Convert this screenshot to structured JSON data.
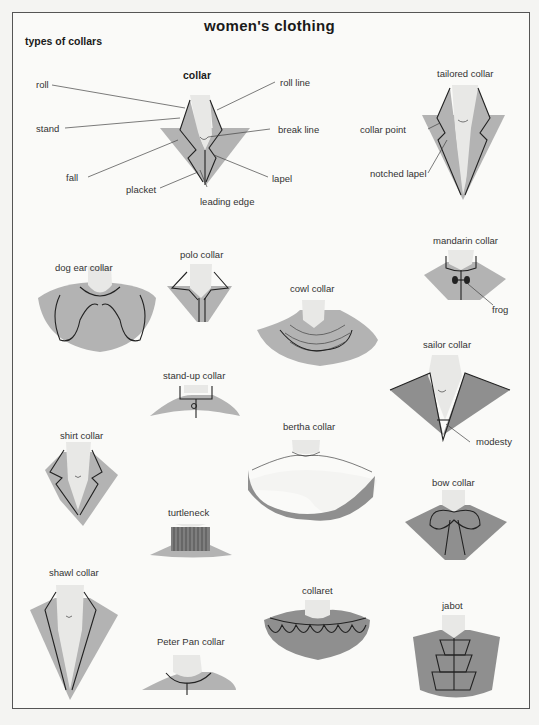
{
  "title": "women's clothing",
  "section": "types of collars",
  "main_diagram": {
    "name": "collar",
    "parts": [
      "roll",
      "stand",
      "fall",
      "placket",
      "leading edge",
      "lapel",
      "break line",
      "roll line"
    ]
  },
  "tailored": {
    "name": "tailored collar",
    "parts": [
      "collar point",
      "notched lapel"
    ]
  },
  "collars": {
    "dog_ear": "dog ear collar",
    "polo": "polo collar",
    "cowl": "cowl collar",
    "mandarin": "mandarin collar",
    "mandarin_part": "frog",
    "stand_up": "stand-up collar",
    "sailor": "sailor collar",
    "sailor_part": "modesty",
    "shirt": "shirt collar",
    "bertha": "bertha collar",
    "turtleneck": "turtleneck",
    "bow": "bow collar",
    "shawl": "shawl collar",
    "collaret": "collaret",
    "jabot": "jabot",
    "peter_pan": "Peter Pan collar"
  },
  "colors": {
    "fabric": "#b3b3b3",
    "fabric_dark": "#8f8f8f",
    "skin": "#e8e8e6",
    "frame": "#555555",
    "background": "#fafaf8"
  }
}
